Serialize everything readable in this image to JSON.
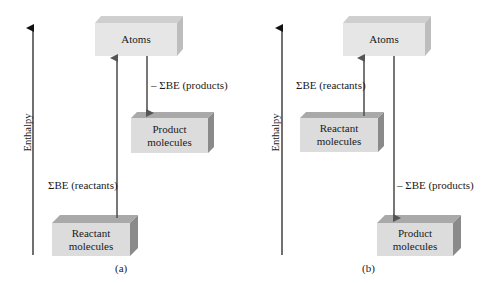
{
  "colors": {
    "front_face": "#dcdcdc",
    "top_face": "#a9a9a9",
    "side_face": "#8a8a8a",
    "atoms_front": "#e6e6e6",
    "atoms_top": "#cfcfcf",
    "atoms_side": "#bdbdbd",
    "arrow": "#555555",
    "axis": "#111111"
  },
  "panel_a": {
    "caption": "(a)",
    "axis_label": "Enthalpy",
    "atoms_box": "Atoms",
    "product_box": [
      "Product",
      "molecules"
    ],
    "reactant_box": [
      "Reactant",
      "molecules"
    ],
    "up_arrow_label": "ΣBE (reactants)",
    "down_arrow_label": "– ΣBE (products)"
  },
  "panel_b": {
    "caption": "(b)",
    "axis_label": "Enthalpy",
    "atoms_box": "Atoms",
    "reactant_box": [
      "Reactant",
      "molecules"
    ],
    "product_box": [
      "Product",
      "molecules"
    ],
    "up_arrow_label": "ΣBE (reactants)",
    "down_arrow_label": "– ΣBE (products)"
  }
}
